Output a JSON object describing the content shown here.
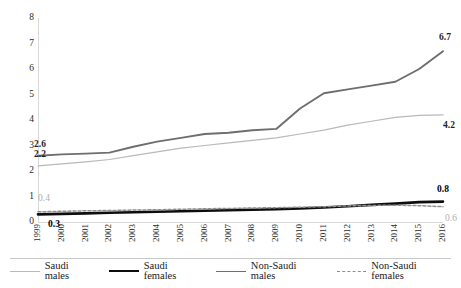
{
  "chart_data": {
    "type": "line",
    "title": "",
    "xlabel": "",
    "ylabel": "",
    "ylim": [
      0,
      8
    ],
    "y_ticks": [
      0,
      1,
      2,
      3,
      4,
      5,
      6,
      7,
      8
    ],
    "grid": false,
    "legend_position": "bottom",
    "x": [
      "1999",
      "2000",
      "2001",
      "2002",
      "2003",
      "2004",
      "2005",
      "2006",
      "2007",
      "2008",
      "2009",
      "2010",
      "2011",
      "2012",
      "2013",
      "2014",
      "2015",
      "2016"
    ],
    "series": [
      {
        "name": "Saudi males",
        "color": "#b9b9b9",
        "style": "solid",
        "width": 1.2,
        "values": [
          2.2,
          2.28,
          2.36,
          2.45,
          2.6,
          2.75,
          2.9,
          3.0,
          3.1,
          3.2,
          3.3,
          3.45,
          3.6,
          3.8,
          3.95,
          4.1,
          4.18,
          4.2
        ]
      },
      {
        "name": "Saudi females",
        "color": "#0d0d0d",
        "style": "solid",
        "width": 2.6,
        "values": [
          0.3,
          0.32,
          0.34,
          0.36,
          0.38,
          0.4,
          0.42,
          0.44,
          0.46,
          0.48,
          0.5,
          0.53,
          0.57,
          0.62,
          0.67,
          0.72,
          0.78,
          0.8
        ]
      },
      {
        "name": "Non-Saudi males",
        "color": "#6e6e6e",
        "style": "solid",
        "width": 1.9,
        "values": [
          2.6,
          2.65,
          2.68,
          2.72,
          2.95,
          3.15,
          3.3,
          3.45,
          3.5,
          3.6,
          3.65,
          4.45,
          5.05,
          5.2,
          5.35,
          5.5,
          6.0,
          6.7
        ]
      },
      {
        "name": "Non-Saudi females",
        "color": "#8f8f8f",
        "style": "dashed",
        "width": 1.5,
        "values": [
          0.4,
          0.42,
          0.44,
          0.45,
          0.47,
          0.48,
          0.5,
          0.52,
          0.53,
          0.55,
          0.56,
          0.58,
          0.6,
          0.63,
          0.65,
          0.66,
          0.64,
          0.6
        ]
      }
    ],
    "annotations": [
      {
        "text": "2.6",
        "series": "Non-Saudi males",
        "point": "1999",
        "value": 2.6,
        "style": "dark"
      },
      {
        "text": "2.2",
        "series": "Saudi males",
        "point": "1999",
        "value": 2.2,
        "style": "dark"
      },
      {
        "text": "0.4",
        "series": "Non-Saudi females",
        "point": "1999",
        "value": 0.4,
        "style": "gray"
      },
      {
        "text": "0.3",
        "series": "Saudi females",
        "point": "1999",
        "value": 0.3,
        "style": "bold"
      },
      {
        "text": "6.7",
        "series": "Non-Saudi males",
        "point": "2016",
        "value": 6.7,
        "style": "dark"
      },
      {
        "text": "4.2",
        "series": "Saudi males",
        "point": "2016",
        "value": 4.2,
        "style": "dark"
      },
      {
        "text": "0.8",
        "series": "Saudi females",
        "point": "2016",
        "value": 0.8,
        "style": "bold"
      },
      {
        "text": "0.6",
        "series": "Non-Saudi females",
        "point": "2016",
        "value": 0.6,
        "style": "gray"
      }
    ]
  },
  "axis": {
    "y_tick_labels": [
      "8",
      "7",
      "6",
      "5",
      "4",
      "3",
      "2",
      "1",
      "0"
    ],
    "x_tick_labels": [
      "1999",
      "2000",
      "2001",
      "2002",
      "2003",
      "2004",
      "2005",
      "2006",
      "2007",
      "2008",
      "2009",
      "2010",
      "2011",
      "2012",
      "2013",
      "2014",
      "2015",
      "2016"
    ]
  },
  "legend": {
    "items": [
      {
        "label": "Saudi males"
      },
      {
        "label": "Saudi females"
      },
      {
        "label": "Non-Saudi males"
      },
      {
        "label": "Non-Saudi females"
      }
    ]
  },
  "labels": {
    "start_nonsaudi_males": "2.6",
    "start_saudi_males": "2.2",
    "start_nonsaudi_females": "0.4",
    "start_saudi_females": "0.3",
    "end_nonsaudi_males": "6.7",
    "end_saudi_males": "4.2",
    "end_saudi_females": "0.8",
    "end_nonsaudi_females": "0.6"
  }
}
